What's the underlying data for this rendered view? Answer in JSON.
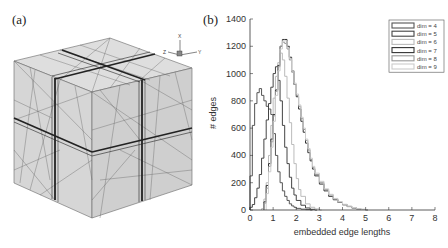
{
  "panels": {
    "a": {
      "label": "(a)"
    },
    "b": {
      "label": "(b)"
    }
  },
  "axes_triad": {
    "x": "X",
    "y": "Y",
    "z": "Z"
  },
  "chart_data": {
    "type": "line",
    "style": "step-histogram",
    "title": "",
    "xlabel": "embedded edge lengths",
    "ylabel": "# edges",
    "xlim": [
      0,
      8
    ],
    "ylim": [
      0,
      1400
    ],
    "xticks": [
      0,
      1,
      2,
      3,
      4,
      5,
      6,
      7,
      8
    ],
    "yticks": [
      0,
      200,
      400,
      600,
      800,
      1000,
      1200,
      1400
    ],
    "legend_position": "top-right",
    "grid": false,
    "series": [
      {
        "name": "dim = 4",
        "color": "#555555",
        "x": [
          0.0,
          0.1,
          0.2,
          0.3,
          0.4,
          0.5,
          0.6,
          0.7,
          0.8,
          0.9,
          1.0,
          1.1,
          1.2,
          1.3,
          1.4,
          1.5,
          1.6,
          1.7,
          1.8,
          1.9,
          2.0,
          2.2,
          2.4,
          2.6
        ],
        "y": [
          250,
          620,
          780,
          860,
          890,
          840,
          800,
          760,
          740,
          700,
          560,
          400,
          280,
          200,
          140,
          100,
          70,
          45,
          30,
          20,
          12,
          6,
          3,
          0
        ]
      },
      {
        "name": "dim = 5",
        "color": "#444444",
        "x": [
          0.0,
          0.1,
          0.2,
          0.3,
          0.4,
          0.5,
          0.6,
          0.7,
          0.8,
          0.9,
          1.0,
          1.1,
          1.2,
          1.3,
          1.4,
          1.5,
          1.6,
          1.7,
          1.8,
          1.9,
          2.0,
          2.2,
          2.4,
          2.6,
          2.8
        ],
        "y": [
          20,
          40,
          90,
          160,
          260,
          380,
          520,
          660,
          780,
          900,
          1000,
          1050,
          950,
          800,
          620,
          460,
          340,
          240,
          160,
          110,
          70,
          35,
          15,
          5,
          0
        ]
      },
      {
        "name": "dim = 6",
        "color": "#bbbbbb",
        "x": [
          0.5,
          0.6,
          0.7,
          0.8,
          0.9,
          1.0,
          1.1,
          1.2,
          1.3,
          1.4,
          1.5,
          1.6,
          1.7,
          1.8,
          1.9,
          2.0,
          2.1,
          2.2,
          2.4,
          2.6,
          2.8,
          3.0
        ],
        "y": [
          10,
          80,
          200,
          400,
          620,
          820,
          980,
          1080,
          1150,
          1100,
          980,
          820,
          640,
          480,
          340,
          230,
          150,
          100,
          45,
          20,
          8,
          0
        ]
      },
      {
        "name": "dim = 7",
        "color": "#333333",
        "x": [
          0.6,
          0.7,
          0.8,
          0.9,
          1.0,
          1.1,
          1.2,
          1.3,
          1.4,
          1.5,
          1.6,
          1.7,
          1.8,
          1.9,
          2.0,
          2.1,
          2.2,
          2.3,
          2.4,
          2.5,
          2.6,
          2.7,
          2.8,
          3.0,
          3.2,
          3.4,
          3.6,
          3.8,
          4.0,
          4.2,
          4.4,
          4.6,
          4.8,
          5.0
        ],
        "y": [
          60,
          180,
          340,
          520,
          700,
          880,
          1060,
          1200,
          1250,
          1250,
          1200,
          1120,
          1020,
          920,
          830,
          740,
          650,
          570,
          490,
          420,
          360,
          300,
          250,
          190,
          140,
          100,
          75,
          55,
          38,
          25,
          15,
          8,
          4,
          0
        ]
      },
      {
        "name": "dim = 8",
        "color": "#999999",
        "x": [
          0.6,
          0.7,
          0.8,
          0.9,
          1.0,
          1.1,
          1.2,
          1.3,
          1.4,
          1.5,
          1.6,
          1.7,
          1.8,
          1.9,
          2.0,
          2.1,
          2.2,
          2.3,
          2.4,
          2.5,
          2.6,
          2.7,
          2.8,
          3.0,
          3.2,
          3.4,
          3.6,
          3.8,
          4.0,
          4.2,
          4.4,
          4.6,
          4.8,
          5.0
        ],
        "y": [
          50,
          160,
          320,
          500,
          690,
          870,
          1050,
          1200,
          1230,
          1220,
          1180,
          1100,
          1010,
          920,
          840,
          760,
          670,
          590,
          510,
          440,
          370,
          310,
          260,
          200,
          150,
          110,
          80,
          58,
          40,
          27,
          17,
          9,
          4,
          0
        ]
      },
      {
        "name": "dim = 9",
        "color": "#cccccc",
        "x": [
          0.7,
          0.8,
          0.9,
          1.0,
          1.1,
          1.2,
          1.3,
          1.4,
          1.5,
          1.6,
          1.7,
          1.8,
          1.9,
          2.0,
          2.1,
          2.2,
          2.3,
          2.4,
          2.5,
          2.6,
          2.7,
          2.8,
          3.0,
          3.2,
          3.4,
          3.6,
          3.8,
          4.0,
          4.2,
          4.4,
          4.6,
          4.8,
          5.0
        ],
        "y": [
          120,
          280,
          460,
          650,
          840,
          1020,
          1180,
          1240,
          1240,
          1190,
          1110,
          1020,
          930,
          850,
          770,
          680,
          600,
          520,
          450,
          380,
          320,
          270,
          210,
          155,
          115,
          85,
          60,
          42,
          28,
          18,
          10,
          5,
          0
        ]
      }
    ]
  }
}
